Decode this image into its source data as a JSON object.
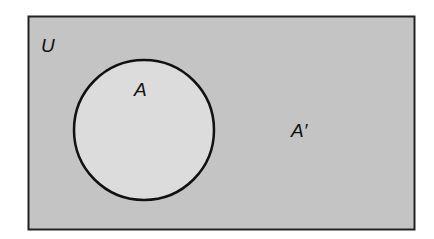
{
  "diagram": {
    "type": "venn",
    "universe_label": "U",
    "set_label": "A",
    "complement_label": "A′",
    "colors": {
      "universe_fill": "#c4c4c4",
      "set_fill": "#dcdcdc",
      "stroke": "#111111",
      "background": "#ffffff"
    }
  }
}
